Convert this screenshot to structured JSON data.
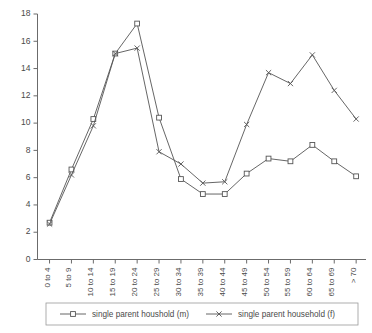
{
  "chart_data": {
    "type": "line",
    "title": "",
    "subtitle": "",
    "xlabel": "",
    "ylabel": "",
    "grid": false,
    "legend_position": "bottom",
    "ylim": [
      0,
      18
    ],
    "ytick_step": 2,
    "yticks": [
      "0",
      "2",
      "4",
      "6",
      "8",
      "10",
      "12",
      "14",
      "16",
      "18"
    ],
    "categories": [
      "0 to 4",
      "5 to 9",
      "10 to 14",
      "15 to 19",
      "20 to 24",
      "25 to 29",
      "30 to 34",
      "35 to 39",
      "40 to 44",
      "45 to 49",
      "50 to 54",
      "55 to 59",
      "60 to 64",
      "65 to 69",
      "> 70"
    ],
    "series": [
      {
        "name": "single parent houshold (m)",
        "marker": "square",
        "color": "#555555",
        "values": [
          2.7,
          6.6,
          10.3,
          15.1,
          17.3,
          10.4,
          5.9,
          4.8,
          4.8,
          6.3,
          7.4,
          7.2,
          8.4,
          7.2,
          6.1
        ]
      },
      {
        "name": "single parent household (f)",
        "marker": "x",
        "color": "#555555",
        "values": [
          2.6,
          6.2,
          9.8,
          15.1,
          15.5,
          7.9,
          7.0,
          5.6,
          5.7,
          9.9,
          13.7,
          12.9,
          15.0,
          12.4,
          10.3
        ]
      }
    ],
    "legend": [
      {
        "label": "single parent houshold (m)",
        "marker": "square"
      },
      {
        "label": "single parent household (f)",
        "marker": "x"
      }
    ]
  }
}
